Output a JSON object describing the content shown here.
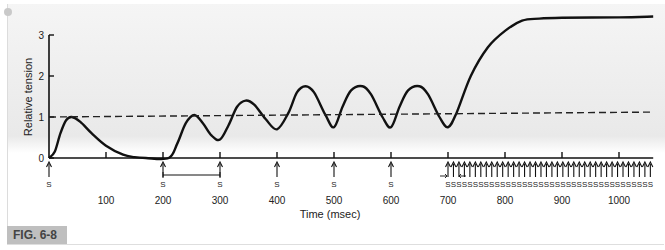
{
  "figure_label": "FIG. 6-8",
  "chart_data": {
    "type": "line",
    "title": "",
    "xlabel": "Time (msec)",
    "ylabel": "Relative tension",
    "xlim": [
      0,
      1060
    ],
    "ylim": [
      0,
      3
    ],
    "x_ticks": [
      100,
      200,
      300,
      400,
      500,
      600,
      700,
      800,
      900,
      1000
    ],
    "x_tick_labels": [
      "100",
      "200",
      "300",
      "400",
      "500",
      "600",
      "700",
      "800",
      "900",
      "1000"
    ],
    "y_ticks": [
      0,
      1,
      2,
      3
    ],
    "y_tick_labels": [
      "0",
      "1",
      "2",
      "3"
    ],
    "grid": false,
    "series": [
      {
        "name": "Tension",
        "style": "solid",
        "x": [
          0,
          10,
          20,
          30,
          40,
          55,
          75,
          100,
          130,
          150,
          170,
          210,
          225,
          240,
          255,
          270,
          285,
          300,
          315,
          330,
          345,
          360,
          380,
          400,
          420,
          435,
          450,
          465,
          485,
          500,
          515,
          530,
          550,
          565,
          585,
          600,
          615,
          630,
          650,
          665,
          685,
          700,
          715,
          740,
          770,
          800,
          830,
          860,
          900,
          1000,
          1060
        ],
        "y": [
          0,
          0.15,
          0.6,
          0.92,
          1.0,
          0.88,
          0.6,
          0.3,
          0.08,
          0.02,
          0,
          0,
          0.35,
          0.85,
          1.05,
          0.85,
          0.55,
          0.45,
          0.8,
          1.25,
          1.4,
          1.3,
          0.95,
          0.7,
          1.1,
          1.6,
          1.75,
          1.6,
          1.05,
          0.75,
          1.25,
          1.65,
          1.75,
          1.55,
          1.0,
          0.75,
          1.25,
          1.65,
          1.75,
          1.55,
          1.0,
          0.75,
          1.1,
          2.0,
          2.7,
          3.1,
          3.35,
          3.4,
          3.42,
          3.43,
          3.45
        ]
      },
      {
        "name": "Reference (single twitch peak)",
        "style": "dashed",
        "x": [
          0,
          1060
        ],
        "y": [
          1.0,
          1.12
        ]
      }
    ],
    "annotations": {
      "stimulus_label": "S",
      "single_stimuli_ms": [
        0,
        200,
        300,
        400,
        500,
        600
      ],
      "tetanic_train_start_ms": 700,
      "tetanic_train_end_ms": 1055,
      "tetanic_train_count": 38,
      "interval_bracket_ms": [
        200,
        300
      ]
    }
  }
}
